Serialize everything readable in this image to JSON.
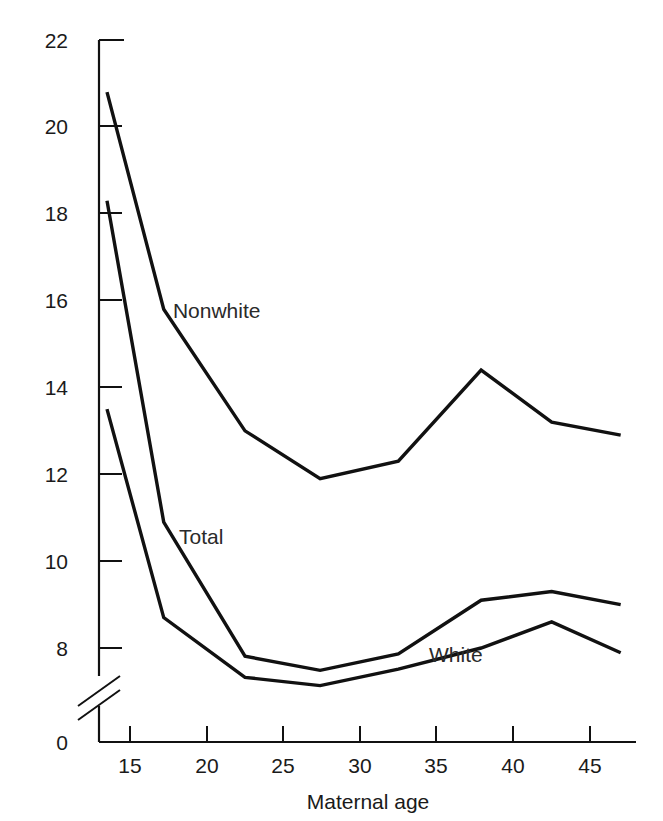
{
  "chart_data": {
    "type": "line",
    "title": "",
    "xlabel": "Maternal age",
    "ylabel": "",
    "xlim": [
      12,
      48
    ],
    "ylim": [
      0,
      22
    ],
    "y_axis_break": true,
    "y_break_between": [
      0,
      7
    ],
    "grid": false,
    "legend": "inline-labels",
    "xticks": [
      15,
      20,
      25,
      30,
      35,
      40,
      45
    ],
    "xtick_labels": [
      "15",
      "20",
      "25",
      "30",
      "35",
      "40",
      "45"
    ],
    "yticks": [
      0,
      8,
      10,
      12,
      14,
      16,
      18,
      20,
      22
    ],
    "ytick_labels": [
      "0",
      "8",
      "10",
      "12",
      "14",
      "16",
      "18",
      "20",
      "22"
    ],
    "x": [
      13.5,
      17.2,
      22.5,
      27.4,
      32.5,
      37.9,
      42.5,
      47.0
    ],
    "series": [
      {
        "name": "Nonwhite",
        "label": "Nonwhite",
        "values": [
          20.8,
          15.8,
          13.0,
          11.9,
          12.3,
          14.4,
          13.2,
          12.9
        ]
      },
      {
        "name": "Total",
        "label": "Total",
        "values": [
          18.3,
          10.9,
          7.3,
          6.1,
          7.5,
          9.1,
          9.3,
          9.0
        ]
      },
      {
        "name": "White",
        "label": "White",
        "values": [
          13.5,
          8.7,
          5.5,
          4.8,
          6.2,
          8.0,
          8.6,
          7.6
        ]
      }
    ],
    "annotations": [
      {
        "text": "Nonwhite",
        "x": 17.8,
        "y": 15.6
      },
      {
        "text": "Total",
        "x": 18.2,
        "y": 10.4
      },
      {
        "text": "White",
        "x": 34.5,
        "y": 6.8
      }
    ],
    "colors": {
      "line": "#111111",
      "axis": "#111111",
      "background": "#ffffff"
    }
  },
  "labels": {
    "y_22": "22",
    "y_20": "20",
    "y_18": "18",
    "y_16": "16",
    "y_14": "14",
    "y_12": "12",
    "y_10": "10",
    "y_8": "8",
    "y_0": "0",
    "x_15": "15",
    "x_20": "20",
    "x_25": "25",
    "x_30": "30",
    "x_35": "35",
    "x_40": "40",
    "x_45": "45",
    "x_axis_title": "Maternal age",
    "series_nonwhite": "Nonwhite",
    "series_total": "Total",
    "series_white": "White"
  }
}
